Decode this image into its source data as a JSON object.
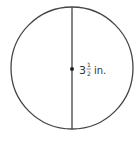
{
  "diagram": {
    "type": "circle-with-diameter",
    "shape": "circle",
    "stroke_color": "#444444",
    "center_dot": true,
    "line": "vertical diameter",
    "label": {
      "whole": "3",
      "numerator": "1",
      "denominator": "2",
      "unit": "in.",
      "full_text": "3 1/2 in."
    }
  }
}
